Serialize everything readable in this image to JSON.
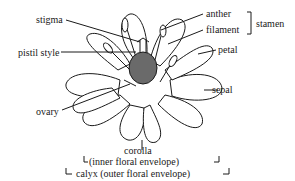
{
  "diagram": {
    "colors": {
      "ink": "#1a1a1a",
      "background": "#ffffff",
      "ovary_fill": "#6a6a6a"
    },
    "labels": {
      "stigma": "stigma",
      "pistil_style": "pistil style",
      "ovary": "ovary",
      "anther": "anther",
      "filament": "filament",
      "stamen": "stamen",
      "petal": "petal",
      "sepal": "sepal",
      "corolla": "corolla",
      "inner_floral_envelope": "(inner floral envelope)",
      "calyx": "calyx (outer floral envelope)"
    }
  }
}
